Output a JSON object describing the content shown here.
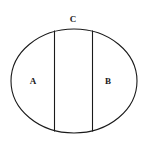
{
  "figure": {
    "background_color": "#ffffff",
    "stroke_color": "#1a1a1a",
    "fill_color": "#ffffff",
    "stroke_width": 1.1,
    "canvas": {
      "width": 148,
      "height": 148
    },
    "ellipse": {
      "name": "outer-ellipse",
      "center_x": 74,
      "center_y": 81,
      "radius_x": 63,
      "radius_y": 52
    },
    "chords": [
      {
        "name": "left-chord",
        "x": 54.5,
        "y_top": 30.5,
        "y_bottom": 131.5,
        "orientation": "vertical"
      },
      {
        "name": "right-chord",
        "x": 92.5,
        "y_top": 30.5,
        "y_bottom": 131.5,
        "orientation": "vertical"
      }
    ],
    "labels": [
      {
        "id": "A",
        "text": "A",
        "x": 33,
        "y": 81,
        "region": "left-segment"
      },
      {
        "id": "B",
        "text": "B",
        "x": 108,
        "y": 81,
        "region": "right-segment"
      },
      {
        "id": "C",
        "text": "C",
        "x": 73,
        "y": 19,
        "region": "middle-band-top"
      }
    ]
  }
}
